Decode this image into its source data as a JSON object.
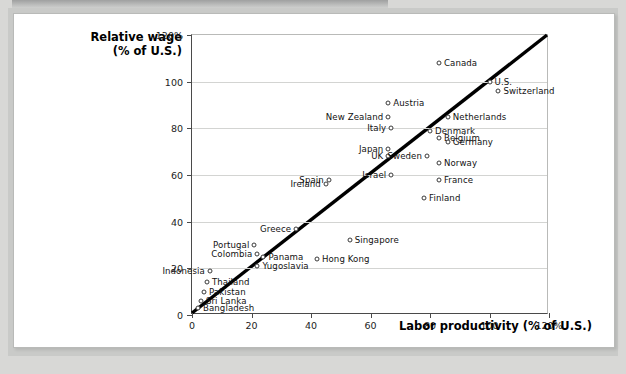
{
  "figure": {
    "y_axis_title_line1": "Relative wage",
    "y_axis_title_line2": "(% of U.S.)",
    "x_axis_title": "Labor productivity (% of U.S.)"
  },
  "chart_data": {
    "type": "scatter",
    "title": "",
    "xlabel": "Labor productivity (% of U.S.)",
    "ylabel": "Relative wage (% of U.S.)",
    "xlim": [
      0,
      120
    ],
    "ylim": [
      0,
      120
    ],
    "xticks": [
      "0",
      "20",
      "40",
      "60",
      "80",
      "100",
      "120%"
    ],
    "yticks": [
      "0",
      "20",
      "40",
      "60",
      "80",
      "100",
      "120%"
    ],
    "grid": "horizontal",
    "legend": "none",
    "annotations": [
      {
        "type": "line",
        "name": "45-degree-line",
        "from": [
          0,
          0
        ],
        "to": [
          120,
          120
        ],
        "color": "#000000"
      }
    ],
    "points": [
      {
        "label": "Canada",
        "x": 83,
        "y": 108,
        "label_side": "right"
      },
      {
        "label": "U.S.",
        "x": 100,
        "y": 100,
        "label_side": "right"
      },
      {
        "label": "Switzerland",
        "x": 103,
        "y": 96,
        "label_side": "right"
      },
      {
        "label": "Austria",
        "x": 66,
        "y": 91,
        "label_side": "right"
      },
      {
        "label": "Netherlands",
        "x": 86,
        "y": 85,
        "label_side": "right"
      },
      {
        "label": "New Zealand",
        "x": 66,
        "y": 85,
        "label_side": "left"
      },
      {
        "label": "Italy",
        "x": 67,
        "y": 80,
        "label_side": "left"
      },
      {
        "label": "Denmark",
        "x": 80,
        "y": 79,
        "label_side": "right"
      },
      {
        "label": "Belgium",
        "x": 83,
        "y": 76,
        "label_side": "right"
      },
      {
        "label": "Germany",
        "x": 86,
        "y": 74,
        "label_side": "right"
      },
      {
        "label": "Japan",
        "x": 66,
        "y": 71,
        "label_side": "left"
      },
      {
        "label": "UK",
        "x": 66,
        "y": 68,
        "label_side": "left"
      },
      {
        "label": "Sweden",
        "x": 79,
        "y": 68,
        "label_side": "left"
      },
      {
        "label": "Norway",
        "x": 83,
        "y": 65,
        "label_side": "right"
      },
      {
        "label": "Israel",
        "x": 67,
        "y": 60,
        "label_side": "left"
      },
      {
        "label": "Spain",
        "x": 46,
        "y": 58,
        "label_side": "left"
      },
      {
        "label": "France",
        "x": 83,
        "y": 58,
        "label_side": "right"
      },
      {
        "label": "Ireland",
        "x": 45,
        "y": 56,
        "label_side": "left"
      },
      {
        "label": "Finland",
        "x": 78,
        "y": 50,
        "label_side": "right"
      },
      {
        "label": "Greece",
        "x": 35,
        "y": 37,
        "label_side": "left"
      },
      {
        "label": "Singapore",
        "x": 53,
        "y": 32,
        "label_side": "right"
      },
      {
        "label": "Portugal",
        "x": 21,
        "y": 30,
        "label_side": "left"
      },
      {
        "label": "Colombia",
        "x": 22,
        "y": 26,
        "label_side": "left"
      },
      {
        "label": "Panama",
        "x": 24,
        "y": 25,
        "label_side": "right"
      },
      {
        "label": "Hong Kong",
        "x": 42,
        "y": 24,
        "label_side": "right"
      },
      {
        "label": "Indonesia",
        "x": 6,
        "y": 19,
        "label_side": "left"
      },
      {
        "label": "Yugoslavia",
        "x": 22,
        "y": 21,
        "label_side": "right"
      },
      {
        "label": "Thailand",
        "x": 5,
        "y": 14,
        "label_side": "right"
      },
      {
        "label": "Pakistan",
        "x": 4,
        "y": 10,
        "label_side": "right"
      },
      {
        "label": "Sri Lanka",
        "x": 3,
        "y": 6,
        "label_side": "right"
      },
      {
        "label": "Bangladesh",
        "x": 2,
        "y": 3,
        "label_side": "right"
      }
    ]
  }
}
